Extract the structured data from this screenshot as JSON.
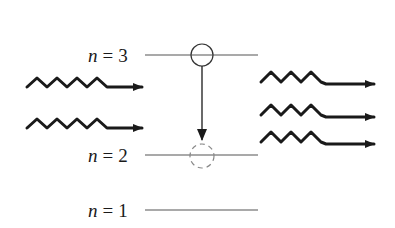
{
  "diagram": {
    "type": "energy-level diagram (stimulated emission)",
    "levels": [
      {
        "label_var": "n",
        "label_eq": "=",
        "label_val": "3",
        "y": 55
      },
      {
        "label_var": "n",
        "label_eq": "=",
        "label_val": "2",
        "y": 155
      },
      {
        "label_var": "n",
        "label_eq": "=",
        "label_val": "1",
        "y": 210
      }
    ],
    "electron_initial": {
      "level": 3,
      "style": "solid-circle"
    },
    "electron_final": {
      "level": 2,
      "style": "dashed-circle"
    },
    "transition_arrow": {
      "from": 3,
      "to": 2,
      "direction": "down"
    },
    "incoming_photons": 2,
    "outgoing_photons": 3,
    "colors": {
      "stroke": "#1a1a1a",
      "level_line": "#555555",
      "dashed": "#777777"
    }
  }
}
